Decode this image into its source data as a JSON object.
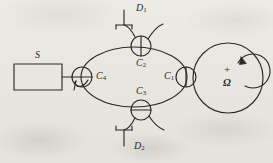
{
  "figure": {
    "name": "sagnac-fiber-optic-gyroscope-schematic",
    "background_color": "#e9e7e2",
    "ink_color": "#2b2a28",
    "width": 273,
    "height": 163
  },
  "components": {
    "source": {
      "label": "S",
      "label_full": "S",
      "role": "light-source-box",
      "box": {
        "x": 14,
        "y": 64,
        "w": 48,
        "h": 26
      }
    },
    "couplers": [
      {
        "id": "c1",
        "label_main": "C",
        "label_sub": "1",
        "label_text": "C1",
        "label_pos": {
          "x": 163,
          "y": 72
        },
        "circle": {
          "cx": 186,
          "cy": 77,
          "r": 10
        },
        "bar": "vertical"
      },
      {
        "id": "c2",
        "label_main": "C",
        "label_sub": "2",
        "label_text": "C2",
        "label_pos": {
          "x": 138,
          "y": 60
        },
        "circle": {
          "cx": 141,
          "cy": 46,
          "r": 10
        },
        "bar": "vertical"
      },
      {
        "id": "c3",
        "label_main": "C",
        "label_sub": "3",
        "label_text": "C3",
        "label_pos": {
          "x": 138,
          "y": 88
        },
        "circle": {
          "cx": 141,
          "cy": 110,
          "r": 10
        },
        "bar": "horizontal"
      },
      {
        "id": "c4",
        "label_main": "C",
        "label_sub": "4",
        "label_text": "C4",
        "label_pos": {
          "x": 96,
          "y": 73
        },
        "circle": {
          "cx": 82,
          "cy": 77,
          "r": 10
        },
        "bar": "horizontal"
      }
    ],
    "detectors": [
      {
        "id": "d1",
        "label_main": "D",
        "label_sub": "1",
        "label_text": "D1",
        "label_pos": {
          "x": 136,
          "y": 4
        },
        "orientation": "stem-up-bar-bottom"
      },
      {
        "id": "d2",
        "label_main": "D",
        "label_sub": "2",
        "label_text": "D2",
        "label_pos": {
          "x": 134,
          "y": 143
        },
        "orientation": "bar-top-stem-down"
      }
    ],
    "fiber_coil": {
      "id": "coil",
      "rotation_label_main": "Ω",
      "rotation_sign": "+",
      "rotation_label_text": "Ω",
      "sign_pos": {
        "x": 228,
        "y": 68
      },
      "omega_pos": {
        "x": 227,
        "y": 81
      },
      "circle": {
        "cx": 228,
        "cy": 78,
        "r": 35
      },
      "arrow_direction": "clockwise"
    },
    "loop": {
      "id": "sagnac-loop",
      "description": "fiber loop ellipse between C4 and C1",
      "ellipse": {
        "cx": 134,
        "cy": 77,
        "rx": 53,
        "ry": 30
      }
    }
  }
}
